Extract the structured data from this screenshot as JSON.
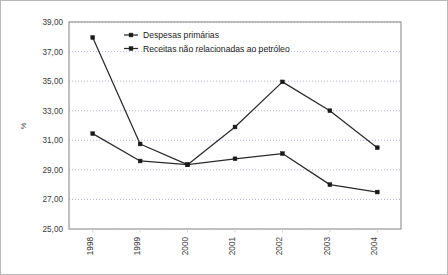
{
  "chart_data": {
    "type": "line",
    "title": "",
    "xlabel": "",
    "ylabel": "%",
    "categories": [
      "1998",
      "1999",
      "2000",
      "2001",
      "2002",
      "2003",
      "2004"
    ],
    "series": [
      {
        "name": "Despesas primárias",
        "values": [
          37.95,
          30.75,
          29.35,
          31.9,
          34.95,
          33.0,
          30.5
        ]
      },
      {
        "name": "Receitas não relacionadas ao petróleo",
        "values": [
          31.45,
          29.6,
          29.35,
          29.75,
          30.1,
          28.0,
          27.5
        ]
      }
    ],
    "ylim": [
      25.0,
      39.0
    ],
    "ytick_step": 2.0,
    "ytick_labels": [
      "25,00",
      "27,00",
      "29,00",
      "31,00",
      "33,00",
      "35,00",
      "37,00",
      "39,00"
    ],
    "ytick_values": [
      25.0,
      27.0,
      29.0,
      31.0,
      33.0,
      35.0,
      37.0,
      39.0
    ],
    "grid": true,
    "grid_style": "dotted-horizontal",
    "legend_position": "top-center-inside",
    "xtick_rotation": -90,
    "decimal_separator": ",",
    "colors": {
      "line": "#2b2b2b",
      "marker": "#1a1a1a",
      "grid": "#9aa7c0",
      "axis": "#8c8c8c",
      "border": "#b9b9b9",
      "background": "#ffffff",
      "text": "#333333"
    }
  }
}
